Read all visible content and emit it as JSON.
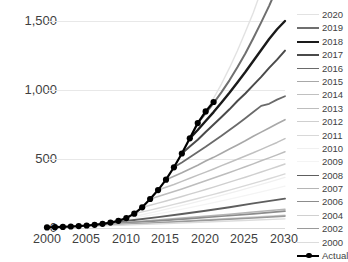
{
  "title": {
    "text": "",
    "note": "title row is cropped off at the top edge of the screenshot"
  },
  "axes": {
    "y_ticks": [
      "0",
      "500",
      "1,000",
      "1,500"
    ],
    "x_ticks": [
      "2000",
      "2005",
      "2010",
      "2015",
      "2020",
      "2025",
      "2030"
    ]
  },
  "legend": {
    "position": "right",
    "entries": [
      {
        "label": "2020",
        "color": "#e2e2e2",
        "width": 1.4
      },
      {
        "label": "2019",
        "color": "#6f6f6f",
        "width": 2.0
      },
      {
        "label": "2018",
        "color": "#1a1a1a",
        "width": 2.4
      },
      {
        "label": "2017",
        "color": "#4a4a4a",
        "width": 2.0
      },
      {
        "label": "2016",
        "color": "#6a6a6a",
        "width": 1.8
      },
      {
        "label": "2015",
        "color": "#a8a8a8",
        "width": 1.6
      },
      {
        "label": "2014",
        "color": "#c0c0c0",
        "width": 1.5
      },
      {
        "label": "2013",
        "color": "#bdbdbd",
        "width": 1.5
      },
      {
        "label": "2012",
        "color": "#cfcfcf",
        "width": 1.4
      },
      {
        "label": "2011",
        "color": "#d8d8d8",
        "width": 1.4
      },
      {
        "label": "2010",
        "color": "#f0f0f0",
        "width": 1.3
      },
      {
        "label": "2009",
        "color": "#f4f4f4",
        "width": 1.3
      },
      {
        "label": "2008",
        "color": "#5e5e5e",
        "width": 1.9
      },
      {
        "label": "2007",
        "color": "#b5b5b5",
        "width": 1.5
      },
      {
        "label": "2006",
        "color": "#8c8c8c",
        "width": 1.7
      },
      {
        "label": "2004",
        "color": "#d0d0d0",
        "width": 1.4
      },
      {
        "label": "2002",
        "color": "#9a9a9a",
        "width": 1.6
      },
      {
        "label": "2000",
        "color": "#dcdcdc",
        "width": 1.4
      },
      {
        "label": "Actual",
        "color": "#000000",
        "width": 2.2,
        "marker": "circle"
      }
    ]
  },
  "chart_data": {
    "type": "line",
    "title": "",
    "xlabel": "",
    "ylabel": "",
    "xlim": [
      2000,
      2030
    ],
    "ylim": [
      0,
      1500
    ],
    "grid": true,
    "legend_position": "right",
    "x": [
      2000,
      2001,
      2002,
      2003,
      2004,
      2005,
      2006,
      2007,
      2008,
      2009,
      2010,
      2011,
      2012,
      2013,
      2014,
      2015,
      2016,
      2017,
      2018,
      2019,
      2020,
      2021,
      2022,
      2023,
      2024,
      2025,
      2026,
      2027,
      2028,
      2029,
      2030
    ],
    "series": [
      {
        "name": "Actual",
        "color": "#000000",
        "width": 2.2,
        "marker": true,
        "x": [
          2000,
          2001,
          2002,
          2003,
          2004,
          2005,
          2006,
          2007,
          2008,
          2009,
          2010,
          2011,
          2012,
          2013,
          2014,
          2015,
          2016,
          2017,
          2018,
          2019,
          2020,
          2021
        ],
        "values": [
          4,
          6,
          8,
          11,
          14,
          18,
          23,
          30,
          39,
          52,
          72,
          104,
          150,
          210,
          275,
          350,
          440,
          540,
          650,
          760,
          845,
          913
        ]
      },
      {
        "name": "2020",
        "color": "#e2e2e2",
        "width": 1.4,
        "x": [
          2020,
          2021,
          2022,
          2023,
          2024,
          2025,
          2026,
          2027,
          2028,
          2029,
          2030
        ],
        "values": [
          845,
          940,
          1045,
          1160,
          1285,
          1420,
          1560,
          1720,
          1890,
          2080,
          2290
        ]
      },
      {
        "name": "2019",
        "color": "#6f6f6f",
        "width": 2.0,
        "x": [
          2019,
          2020,
          2021,
          2022,
          2023,
          2024,
          2025,
          2026,
          2027,
          2028,
          2029,
          2030
        ],
        "values": [
          760,
          830,
          905,
          985,
          1070,
          1165,
          1265,
          1375,
          1490,
          1610,
          1740,
          1880
        ]
      },
      {
        "name": "2018",
        "color": "#1a1a1a",
        "width": 2.4,
        "x": [
          2018,
          2019,
          2020,
          2021,
          2022,
          2023,
          2024,
          2025,
          2026,
          2027,
          2028,
          2029,
          2030
        ],
        "values": [
          650,
          710,
          775,
          840,
          910,
          980,
          1055,
          1130,
          1210,
          1290,
          1370,
          1440,
          1500
        ]
      },
      {
        "name": "2017",
        "color": "#4a4a4a",
        "width": 2.0,
        "x": [
          2017,
          2018,
          2019,
          2020,
          2021,
          2022,
          2023,
          2024,
          2025,
          2026,
          2027,
          2028,
          2029,
          2030
        ],
        "values": [
          540,
          590,
          640,
          695,
          750,
          805,
          860,
          920,
          975,
          1035,
          1095,
          1160,
          1220,
          1285
        ]
      },
      {
        "name": "2016",
        "color": "#6a6a6a",
        "width": 1.8,
        "x": [
          2016,
          2017,
          2018,
          2019,
          2020,
          2021,
          2022,
          2023,
          2024,
          2025,
          2026,
          2027,
          2028,
          2029,
          2030
        ],
        "values": [
          440,
          475,
          512,
          550,
          588,
          628,
          668,
          710,
          752,
          795,
          840,
          885,
          900,
          930,
          955
        ]
      },
      {
        "name": "2015",
        "color": "#a8a8a8",
        "width": 1.6,
        "x": [
          2015,
          2016,
          2017,
          2018,
          2019,
          2020,
          2021,
          2022,
          2023,
          2024,
          2025,
          2026,
          2027,
          2028,
          2029,
          2030
        ],
        "values": [
          350,
          375,
          400,
          428,
          455,
          485,
          512,
          542,
          572,
          602,
          632,
          665,
          695,
          725,
          755,
          785
        ]
      },
      {
        "name": "2014",
        "color": "#c0c0c0",
        "width": 1.5,
        "x": [
          2014,
          2015,
          2016,
          2017,
          2018,
          2019,
          2020,
          2021,
          2022,
          2023,
          2024,
          2025,
          2026,
          2027,
          2028,
          2029,
          2030
        ],
        "values": [
          275,
          295,
          315,
          338,
          360,
          383,
          405,
          428,
          452,
          475,
          498,
          522,
          545,
          570,
          595,
          620,
          648
        ]
      },
      {
        "name": "2013",
        "color": "#bdbdbd",
        "width": 1.5,
        "x": [
          2013,
          2014,
          2015,
          2016,
          2017,
          2018,
          2019,
          2020,
          2021,
          2022,
          2023,
          2024,
          2025,
          2026,
          2027,
          2028,
          2029,
          2030
        ],
        "values": [
          210,
          228,
          246,
          265,
          283,
          302,
          322,
          342,
          362,
          382,
          402,
          423,
          444,
          465,
          487,
          508,
          530,
          552
        ]
      },
      {
        "name": "2012",
        "color": "#cfcfcf",
        "width": 1.4,
        "x": [
          2012,
          2013,
          2014,
          2015,
          2016,
          2017,
          2018,
          2019,
          2020,
          2021,
          2022,
          2023,
          2024,
          2025,
          2026,
          2027,
          2028,
          2029,
          2030
        ],
        "values": [
          150,
          165,
          180,
          196,
          212,
          228,
          245,
          262,
          279,
          296,
          314,
          332,
          350,
          368,
          387,
          406,
          425,
          444,
          464
        ]
      },
      {
        "name": "2011",
        "color": "#d8d8d8",
        "width": 1.4,
        "x": [
          2011,
          2012,
          2013,
          2014,
          2015,
          2016,
          2017,
          2018,
          2019,
          2020,
          2021,
          2022,
          2023,
          2024,
          2025,
          2026,
          2027,
          2028,
          2029,
          2030
        ],
        "values": [
          104,
          117,
          130,
          143,
          157,
          171,
          185,
          199,
          214,
          229,
          244,
          259,
          275,
          291,
          307,
          323,
          340,
          357,
          374,
          392
        ]
      },
      {
        "name": "2010",
        "color": "#f0f0f0",
        "width": 1.3,
        "x": [
          2010,
          2012,
          2014,
          2016,
          2018,
          2020,
          2022,
          2024,
          2026,
          2028,
          2030
        ],
        "values": [
          72,
          96,
          122,
          149,
          177,
          206,
          236,
          267,
          299,
          332,
          366
        ]
      },
      {
        "name": "2009",
        "color": "#f4f4f4",
        "width": 1.3,
        "x": [
          2009,
          2012,
          2015,
          2018,
          2021,
          2024,
          2027,
          2030
        ],
        "values": [
          52,
          82,
          114,
          148,
          184,
          222,
          262,
          304
        ]
      },
      {
        "name": "2008",
        "color": "#5e5e5e",
        "width": 1.9,
        "x": [
          2008,
          2011,
          2014,
          2017,
          2020,
          2023,
          2026,
          2030
        ],
        "values": [
          39,
          58,
          79,
          101,
          125,
          150,
          178,
          213
        ]
      },
      {
        "name": "2007",
        "color": "#b5b5b5",
        "width": 1.5,
        "x": [
          2007,
          2011,
          2015,
          2019,
          2023,
          2026,
          2030
        ],
        "values": [
          30,
          46,
          63,
          81,
          100,
          116,
          136
        ]
      },
      {
        "name": "2006",
        "color": "#8c8c8c",
        "width": 1.7,
        "x": [
          2006,
          2010,
          2014,
          2018,
          2022,
          2026,
          2030
        ],
        "values": [
          23,
          37,
          52,
          68,
          85,
          103,
          122
        ]
      },
      {
        "name": "2004",
        "color": "#d0d0d0",
        "width": 1.4,
        "x": [
          2004,
          2009,
          2014,
          2019,
          2024,
          2030
        ],
        "values": [
          14,
          27,
          41,
          56,
          72,
          92
        ]
      },
      {
        "name": "2002",
        "color": "#9a9a9a",
        "width": 1.6,
        "x": [
          2002,
          2008,
          2014,
          2020,
          2026,
          2030
        ],
        "values": [
          8,
          22,
          38,
          55,
          73,
          86
        ]
      },
      {
        "name": "2000",
        "color": "#dcdcdc",
        "width": 1.4,
        "x": [
          2000,
          2008,
          2016,
          2024,
          2030
        ],
        "values": [
          4,
          18,
          34,
          52,
          66
        ]
      }
    ]
  }
}
